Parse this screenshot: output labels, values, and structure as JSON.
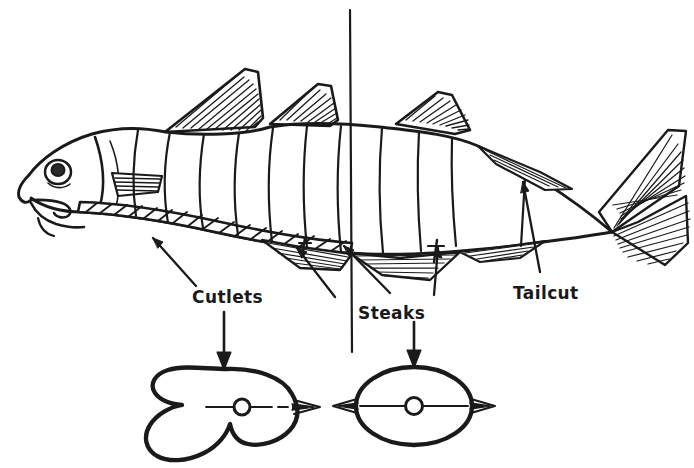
{
  "figure": {
    "background_color": "#ffffff",
    "ink_color": "#1a1a1a"
  },
  "labels": {
    "cutlets": "Cutlets",
    "steaks": "Steaks",
    "tailcut": "Tailcut"
  },
  "cross_sections": {
    "cutlet": {
      "name": "cutlet-cross-section",
      "description": "V-shaped belly-flap cross section with central backbone"
    },
    "steak": {
      "name": "steak-cross-section",
      "description": "Oval cross section with central backbone"
    }
  },
  "parts": {
    "fish_body": "fish-body",
    "head": "fish-head",
    "eye": "fish-eye",
    "mouth": "fish-mouth",
    "pectoral_fin": "pectoral-fin",
    "dorsal_fin_front": "dorsal-fin-front",
    "dorsal_fin_rear": "dorsal-fin-rear",
    "adipose_fin": "adipose-fin",
    "anal_fin": "anal-fin",
    "pelvic_fin": "pelvic-fin",
    "tail_fin": "tail-fin",
    "belly_band": "hatched-belly-band",
    "cut_lines": "body-cut-lines",
    "section_line": "vertical-section-line"
  }
}
